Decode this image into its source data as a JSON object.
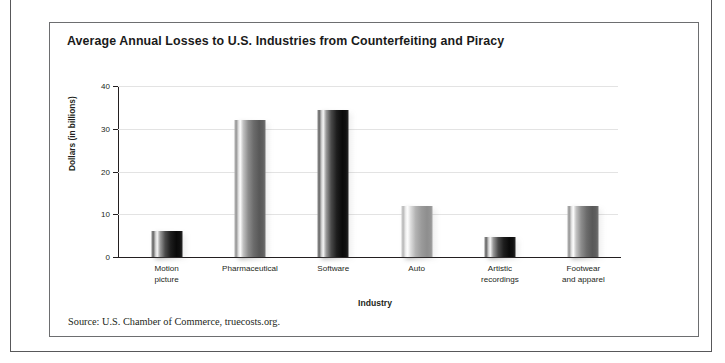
{
  "figure": {
    "title": "Average Annual Losses to U.S. Industries from Counterfeiting and Piracy",
    "source_note": "Source: U.S. Chamber of Commerce, truecosts.org."
  },
  "chart_data": {
    "type": "bar",
    "title": "Average Annual Losses to U.S. Industries from Counterfeiting and Piracy",
    "xlabel": "Industry",
    "ylabel": "Dollars (in billions)",
    "ylim": [
      0,
      40
    ],
    "yticks": [
      "0",
      "10",
      "20",
      "30",
      "40"
    ],
    "ytick_values": [
      0,
      10,
      20,
      30,
      40
    ],
    "grid": true,
    "legend": "none",
    "categories": [
      "Motion picture",
      "Pharmaceutical",
      "Software",
      "Auto",
      "Artistic recordings",
      "Footwear and apparel"
    ],
    "category_lines": [
      [
        "Motion",
        "picture"
      ],
      [
        "Pharmaceutical"
      ],
      [
        "Software"
      ],
      [
        "Auto"
      ],
      [
        "Artistic",
        "recordings"
      ],
      [
        "Footwear",
        "and apparel"
      ]
    ],
    "values": [
      6,
      32,
      34.5,
      12,
      4.7,
      12
    ],
    "bar_shades": [
      "dark",
      "mid",
      "dark",
      "light",
      "dark",
      "mid"
    ],
    "colors": {
      "bar_dark": "#1d1d1d",
      "bar_mid": "#6b6b6b",
      "bar_light": "#9b9b9b",
      "axis": "#231f20",
      "gridline": "#e3e3e3",
      "frame": "#6d6e70"
    }
  }
}
